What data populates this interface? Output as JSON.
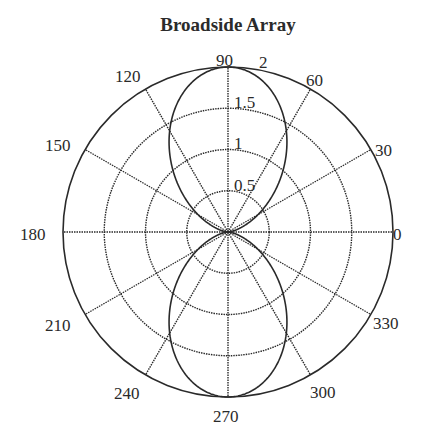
{
  "chart_data": {
    "type": "polar-line",
    "title": "Broadside Array",
    "xlabel": "",
    "ylabel": "",
    "angle_unit": "degrees",
    "angle_ticks": [
      0,
      30,
      60,
      90,
      120,
      150,
      180,
      210,
      240,
      270,
      300,
      330
    ],
    "radial_ticks": [
      0.5,
      1,
      1.5,
      2
    ],
    "radial_tick_labels": [
      "0.5",
      "1",
      "1.5",
      "2"
    ],
    "rlim": [
      0,
      2
    ],
    "grid": true,
    "grid_style": "dotted",
    "series": [
      {
        "name": "Broadside Array pattern |2cos((pi/2)cos(theta))|",
        "theta": [
          0,
          15,
          30,
          45,
          60,
          75,
          90,
          105,
          120,
          135,
          150,
          165,
          180,
          195,
          210,
          225,
          240,
          255,
          270,
          285,
          300,
          315,
          330,
          345,
          360
        ],
        "r": [
          0.0,
          0.11,
          0.42,
          0.89,
          1.41,
          1.83,
          2.0,
          1.83,
          1.41,
          0.89,
          0.42,
          0.11,
          0.0,
          0.11,
          0.42,
          0.89,
          1.41,
          1.83,
          2.0,
          1.83,
          1.41,
          0.89,
          0.42,
          0.11,
          0.0
        ]
      }
    ]
  },
  "labels": {
    "title": "Broadside Array",
    "angles": [
      "0",
      "30",
      "60",
      "90",
      "120",
      "150",
      "180",
      "210",
      "240",
      "270",
      "300",
      "330"
    ],
    "radial": [
      "0.5",
      "1",
      "1.5",
      "2"
    ]
  }
}
